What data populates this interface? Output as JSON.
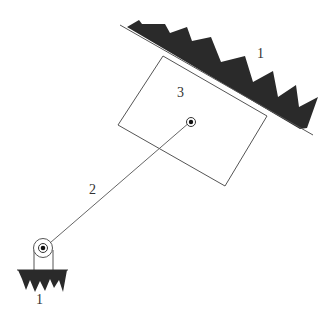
{
  "diagram": {
    "type": "mechanism-schematic",
    "colors": {
      "line": "#555555",
      "ground_fill": "#2a2a2a",
      "text": "#333333"
    },
    "labels": {
      "ground_top": "1",
      "block": "3",
      "link": "2",
      "ground_bottom": "1"
    },
    "components": [
      {
        "id": "ground_inclined",
        "label": "1",
        "kind": "fixed inclined surface (hatched)"
      },
      {
        "id": "block",
        "label": "3",
        "kind": "sliding rectangular block"
      },
      {
        "id": "link",
        "label": "2",
        "kind": "connecting rod"
      },
      {
        "id": "ground_pivot",
        "label": "1",
        "kind": "fixed pivot support (hatched)"
      }
    ]
  }
}
